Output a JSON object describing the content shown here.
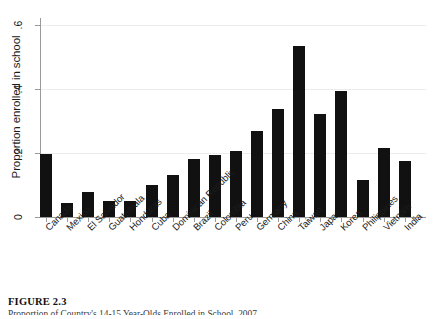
{
  "figure": {
    "label": "FIGURE 2.3",
    "caption": "Proportion of Country's 14-15 Year-Olds Enrolled in School, 2007"
  },
  "chart_data": {
    "type": "bar",
    "title": "",
    "subtitle": "",
    "xlabel": "",
    "ylabel": "Proportion enrolled in school",
    "ylim": [
      0,
      0.6
    ],
    "yticks": [
      0,
      0.2,
      0.4,
      0.6
    ],
    "ytick_labels": [
      "0",
      ".2",
      ".4",
      ".6"
    ],
    "grid": "horizontal",
    "legend": "none",
    "bar_color": "#111111",
    "categories": [
      "Canada",
      "Mexico",
      "El Salvador",
      "Guatemala",
      "Honduras",
      "Cuba",
      "Dominican Republic",
      "Brazil",
      "Colombia",
      "Peru",
      "Germany",
      "China",
      "Taiwan",
      "Japan",
      "Korea",
      "Philippines",
      "Vietnam",
      "India"
    ],
    "values": [
      0.196,
      0.044,
      0.079,
      0.051,
      0.051,
      0.101,
      0.132,
      0.181,
      0.194,
      0.206,
      0.268,
      0.337,
      0.535,
      0.322,
      0.393,
      0.116,
      0.216,
      0.175
    ]
  }
}
